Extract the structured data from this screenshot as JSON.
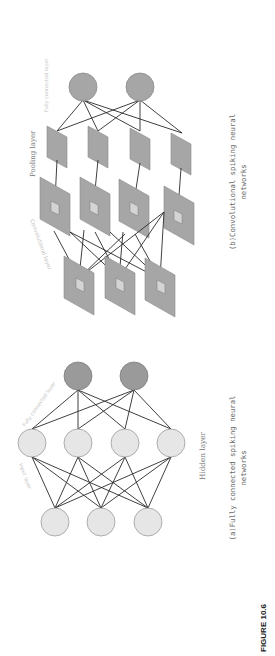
{
  "figure": {
    "label": "FIGURE 10.6"
  },
  "panel_b": {
    "caption_line1": "(b)Convolutional spiking neural",
    "caption_line2": "networks",
    "labels": {
      "fully_connected": "Fully connected layer",
      "pooling": "Pooling layer",
      "convolutional": "Convolutional layer"
    },
    "colors": {
      "node_fill": "#a6a6a6",
      "node_stroke": "#8c8c8c",
      "inner_fill": "#d4d4d4",
      "edge": "#2a2a2a"
    },
    "output_nodes": 2,
    "pooling_maps": 4,
    "feature_maps": 4,
    "input_maps": 3
  },
  "panel_a": {
    "caption_line1": "(a)Fully connected spiking neural",
    "caption_line2": "networks",
    "labels": {
      "hidden": "Hidden layer",
      "fully_connected": "Fully connected layer",
      "input": "Input layer"
    },
    "colors": {
      "output_fill": "#9a9a9a",
      "node_fill": "#e6e6e6",
      "node_stroke": "#9c9c9c",
      "edge": "#2a2a2a"
    },
    "output_nodes": 2,
    "hidden_nodes": 4,
    "input_nodes": 3
  }
}
